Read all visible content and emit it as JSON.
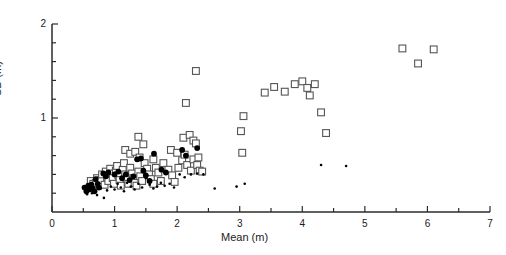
{
  "chart_data": {
    "type": "scatter",
    "title": "",
    "xlabel": "Mean (m)",
    "ylabel": "SD (m)",
    "xlim": [
      0,
      7
    ],
    "ylim": [
      0,
      2
    ],
    "xticks": [
      0,
      1,
      2,
      3,
      4,
      5,
      6,
      7
    ],
    "xticklabels": [
      "0",
      "1",
      "2",
      "3",
      "4",
      "5",
      "6",
      "7"
    ],
    "xminor_step": 0.5,
    "yticks": [
      1,
      2
    ],
    "yticklabels": [
      "1",
      "2"
    ],
    "yminor_step": 0.2,
    "grid": false,
    "legend": null,
    "series": [
      {
        "name": "open-squares",
        "marker": "open-square",
        "color": "#555555",
        "points": [
          [
            0.62,
            0.33
          ],
          [
            0.66,
            0.3
          ],
          [
            0.7,
            0.31
          ],
          [
            0.72,
            0.36
          ],
          [
            0.78,
            0.34
          ],
          [
            0.8,
            0.4
          ],
          [
            0.84,
            0.29
          ],
          [
            0.86,
            0.43
          ],
          [
            0.88,
            0.37
          ],
          [
            0.9,
            0.33
          ],
          [
            0.93,
            0.46
          ],
          [
            0.95,
            0.41
          ],
          [
            0.97,
            0.36
          ],
          [
            0.99,
            0.3
          ],
          [
            1.02,
            0.44
          ],
          [
            1.04,
            0.49
          ],
          [
            1.06,
            0.39
          ],
          [
            1.08,
            0.34
          ],
          [
            1.1,
            0.28
          ],
          [
            1.13,
            0.45
          ],
          [
            1.15,
            0.52
          ],
          [
            1.17,
            0.4
          ],
          [
            1.2,
            0.35
          ],
          [
            1.22,
            0.3
          ],
          [
            1.25,
            0.47
          ],
          [
            1.28,
            0.41
          ],
          [
            1.3,
            0.36
          ],
          [
            1.32,
            0.31
          ],
          [
            1.35,
            0.28
          ],
          [
            1.38,
            0.43
          ],
          [
            1.41,
            0.38
          ],
          [
            1.44,
            0.33
          ],
          [
            1.17,
            0.66
          ],
          [
            1.25,
            0.62
          ],
          [
            1.33,
            0.64
          ],
          [
            1.4,
            0.58
          ],
          [
            1.48,
            0.52
          ],
          [
            1.52,
            0.46
          ],
          [
            1.55,
            0.4
          ],
          [
            1.58,
            0.35
          ],
          [
            1.62,
            0.3
          ],
          [
            1.66,
            0.47
          ],
          [
            1.7,
            0.42
          ],
          [
            1.74,
            0.33
          ],
          [
            1.38,
            0.8
          ],
          [
            1.46,
            0.72
          ],
          [
            1.62,
            0.56
          ],
          [
            1.78,
            0.52
          ],
          [
            1.86,
            0.45
          ],
          [
            1.92,
            0.39
          ],
          [
            1.96,
            0.32
          ],
          [
            2.02,
            0.47
          ],
          [
            2.08,
            0.55
          ],
          [
            2.12,
            0.61
          ],
          [
            2.16,
            0.5
          ],
          [
            2.22,
            0.44
          ],
          [
            1.9,
            0.66
          ],
          [
            2.0,
            0.63
          ],
          [
            2.26,
            0.56
          ],
          [
            2.32,
            0.5
          ],
          [
            2.36,
            0.44
          ],
          [
            2.1,
            0.79
          ],
          [
            2.2,
            0.82
          ],
          [
            2.26,
            0.76
          ],
          [
            2.3,
            0.73
          ],
          [
            2.34,
            0.58
          ],
          [
            2.4,
            0.43
          ],
          [
            2.14,
            1.16
          ],
          [
            2.3,
            1.5
          ],
          [
            3.02,
            0.86
          ],
          [
            3.04,
            0.63
          ],
          [
            3.06,
            1.02
          ],
          [
            3.4,
            1.27
          ],
          [
            3.55,
            1.33
          ],
          [
            3.72,
            1.28
          ],
          [
            3.88,
            1.36
          ],
          [
            4.0,
            1.39
          ],
          [
            4.08,
            1.32
          ],
          [
            4.12,
            1.24
          ],
          [
            4.2,
            1.36
          ],
          [
            4.3,
            1.06
          ],
          [
            4.38,
            0.84
          ],
          [
            5.6,
            1.74
          ],
          [
            6.1,
            1.73
          ],
          [
            5.85,
            1.58
          ]
        ]
      },
      {
        "name": "filled-circles",
        "marker": "filled-circle",
        "color": "#000000",
        "points": [
          [
            0.52,
            0.26
          ],
          [
            0.55,
            0.22
          ],
          [
            0.58,
            0.28
          ],
          [
            0.6,
            0.24
          ],
          [
            0.63,
            0.29
          ],
          [
            0.65,
            0.25
          ],
          [
            0.68,
            0.22
          ],
          [
            0.7,
            0.35
          ],
          [
            0.73,
            0.3
          ],
          [
            0.75,
            0.26
          ],
          [
            0.82,
            0.41
          ],
          [
            0.86,
            0.38
          ],
          [
            0.9,
            0.42
          ],
          [
            1.0,
            0.4
          ],
          [
            1.06,
            0.43
          ],
          [
            1.12,
            0.36
          ],
          [
            1.18,
            0.4
          ],
          [
            1.24,
            0.34
          ],
          [
            1.3,
            0.38
          ],
          [
            1.36,
            0.56
          ],
          [
            1.42,
            0.57
          ],
          [
            1.46,
            0.44
          ],
          [
            1.5,
            0.39
          ],
          [
            1.56,
            0.33
          ],
          [
            1.63,
            0.62
          ],
          [
            1.75,
            0.45
          ],
          [
            1.82,
            0.42
          ],
          [
            2.08,
            0.66
          ],
          [
            2.14,
            0.6
          ],
          [
            2.32,
            0.68
          ]
        ]
      },
      {
        "name": "small-dots",
        "marker": "small-dot",
        "color": "#000000",
        "points": [
          [
            0.56,
            0.19
          ],
          [
            0.64,
            0.2
          ],
          [
            0.72,
            0.18
          ],
          [
            0.78,
            0.25
          ],
          [
            0.83,
            0.15
          ],
          [
            0.88,
            0.23
          ],
          [
            0.94,
            0.27
          ],
          [
            1.0,
            0.24
          ],
          [
            1.05,
            0.3
          ],
          [
            1.1,
            0.26
          ],
          [
            1.15,
            0.22
          ],
          [
            1.2,
            0.31
          ],
          [
            1.26,
            0.27
          ],
          [
            1.32,
            0.24
          ],
          [
            1.38,
            0.3
          ],
          [
            1.44,
            0.26
          ],
          [
            1.5,
            0.36
          ],
          [
            1.56,
            0.29
          ],
          [
            1.62,
            0.25
          ],
          [
            1.68,
            0.27
          ],
          [
            1.74,
            0.31
          ],
          [
            1.8,
            0.28
          ],
          [
            1.88,
            0.3
          ],
          [
            1.95,
            0.26
          ],
          [
            2.04,
            0.4
          ],
          [
            2.12,
            0.37
          ],
          [
            2.22,
            0.4
          ],
          [
            2.32,
            0.41
          ],
          [
            2.42,
            0.4
          ],
          [
            2.6,
            0.25
          ],
          [
            2.95,
            0.27
          ],
          [
            3.08,
            0.3
          ],
          [
            4.3,
            0.5
          ],
          [
            4.7,
            0.49
          ]
        ]
      }
    ]
  },
  "axes": {
    "x_label": "Mean (m)",
    "y_label": "SD (m)"
  }
}
